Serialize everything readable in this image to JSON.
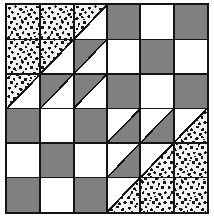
{
  "artwork": {
    "title": "Patchwork Quilt Block",
    "type": "quilt-block-diagram",
    "grid_rows": 6,
    "grid_cols": 6,
    "description": "Six-by-six pieced quilt block with two large stippled right triangles in opposite corners, checkerboard fields, and half-square triangle units forming a diagonal band."
  },
  "colors": {
    "background": "#ffffff",
    "light": "#ffffff",
    "medium_gray": "#808080",
    "outline": "#141414",
    "stipple_base": "#f2f2f2",
    "stipple_dots": "#1a1a1a"
  },
  "legend": {
    "light_label": "Light / White",
    "gray_label": "Medium Gray",
    "stipple_label": "Stipple Print"
  },
  "geometry": {
    "frame_x": 5,
    "frame_y": 3,
    "frame_width": 204,
    "frame_height": 211,
    "border_width": 2,
    "cell_width": 33.333,
    "cell_height": 34.5
  },
  "big_triangles": [
    {
      "name": "upper-left-stipple-triangle",
      "fill": "stipple",
      "span_cols": 3,
      "span_rows": 3,
      "orientation": "upper-left",
      "points": "0,0 100,0 0,50"
    },
    {
      "name": "lower-right-stipple-triangle",
      "fill": "stipple",
      "span_cols": 3,
      "span_rows": 3,
      "orientation": "lower-right",
      "points": "100,50 100,100 0,100"
    }
  ],
  "cells": [
    {
      "r": 0,
      "c": 0,
      "fill": "stipple",
      "shape": "full",
      "name": "cell-r1c1"
    },
    {
      "r": 0,
      "c": 1,
      "fill": "stipple",
      "shape": "full",
      "name": "cell-r1c2"
    },
    {
      "r": 0,
      "c": 2,
      "fill": "stipple",
      "shape": "tri-ul",
      "name": "cell-r1c3"
    },
    {
      "r": 0,
      "c": 3,
      "fill": "gray",
      "shape": "full",
      "name": "cell-r1c4"
    },
    {
      "r": 0,
      "c": 4,
      "fill": "light",
      "shape": "full",
      "name": "cell-r1c5"
    },
    {
      "r": 0,
      "c": 5,
      "fill": "gray",
      "shape": "full",
      "name": "cell-r1c6"
    },
    {
      "r": 1,
      "c": 0,
      "fill": "stipple",
      "shape": "full",
      "name": "cell-r2c1"
    },
    {
      "r": 1,
      "c": 1,
      "fill": "stipple",
      "shape": "tri-ul",
      "name": "cell-r2c2"
    },
    {
      "r": 1,
      "c": 2,
      "fill": "gray",
      "shape": "tri-ul",
      "name": "cell-r2c3"
    },
    {
      "r": 1,
      "c": 3,
      "fill": "light",
      "shape": "full",
      "name": "cell-r2c4"
    },
    {
      "r": 1,
      "c": 4,
      "fill": "gray",
      "shape": "full",
      "name": "cell-r2c5"
    },
    {
      "r": 1,
      "c": 5,
      "fill": "light",
      "shape": "full",
      "name": "cell-r2c6"
    },
    {
      "r": 2,
      "c": 0,
      "fill": "stipple",
      "shape": "tri-ul",
      "name": "cell-r3c1"
    },
    {
      "r": 2,
      "c": 1,
      "fill": "gray",
      "shape": "tri-ul",
      "name": "cell-r3c2"
    },
    {
      "r": 2,
      "c": 2,
      "fill": "gray",
      "shape": "tri-ul",
      "name": "cell-r3c3"
    },
    {
      "r": 2,
      "c": 3,
      "fill": "gray",
      "shape": "full",
      "name": "cell-r3c4"
    },
    {
      "r": 2,
      "c": 4,
      "fill": "light",
      "shape": "full",
      "name": "cell-r3c5"
    },
    {
      "r": 2,
      "c": 5,
      "fill": "gray",
      "shape": "full",
      "name": "cell-r3c6"
    },
    {
      "r": 3,
      "c": 0,
      "fill": "gray",
      "shape": "full",
      "name": "cell-r4c1"
    },
    {
      "r": 3,
      "c": 1,
      "fill": "light",
      "shape": "full",
      "name": "cell-r4c2"
    },
    {
      "r": 3,
      "c": 2,
      "fill": "gray",
      "shape": "full",
      "name": "cell-r4c3"
    },
    {
      "r": 3,
      "c": 3,
      "fill": "gray",
      "shape": "tri-lr",
      "name": "cell-r4c4"
    },
    {
      "r": 3,
      "c": 4,
      "fill": "gray",
      "shape": "tri-lr",
      "name": "cell-r4c5"
    },
    {
      "r": 3,
      "c": 5,
      "fill": "stipple",
      "shape": "tri-lr",
      "name": "cell-r4c6"
    },
    {
      "r": 4,
      "c": 0,
      "fill": "light",
      "shape": "full",
      "name": "cell-r5c1"
    },
    {
      "r": 4,
      "c": 1,
      "fill": "gray",
      "shape": "full",
      "name": "cell-r5c2"
    },
    {
      "r": 4,
      "c": 2,
      "fill": "light",
      "shape": "full",
      "name": "cell-r5c3"
    },
    {
      "r": 4,
      "c": 3,
      "fill": "gray",
      "shape": "tri-lr",
      "name": "cell-r5c4"
    },
    {
      "r": 4,
      "c": 4,
      "fill": "stipple",
      "shape": "tri-lr",
      "name": "cell-r5c5"
    },
    {
      "r": 4,
      "c": 5,
      "fill": "stipple",
      "shape": "full",
      "name": "cell-r5c6"
    },
    {
      "r": 5,
      "c": 0,
      "fill": "gray",
      "shape": "full",
      "name": "cell-r6c1"
    },
    {
      "r": 5,
      "c": 1,
      "fill": "light",
      "shape": "full",
      "name": "cell-r6c2"
    },
    {
      "r": 5,
      "c": 2,
      "fill": "gray",
      "shape": "full",
      "name": "cell-r6c3"
    },
    {
      "r": 5,
      "c": 3,
      "fill": "stipple",
      "shape": "tri-lr",
      "name": "cell-r6c4"
    },
    {
      "r": 5,
      "c": 4,
      "fill": "stipple",
      "shape": "full",
      "name": "cell-r6c5"
    },
    {
      "r": 5,
      "c": 5,
      "fill": "stipple",
      "shape": "full",
      "name": "cell-r6c6"
    }
  ]
}
